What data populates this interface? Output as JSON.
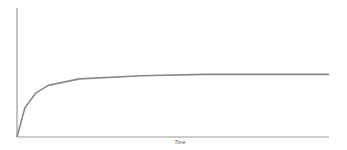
{
  "chart_data": {
    "type": "line",
    "title": "",
    "xlabel": "Time",
    "ylabel": "",
    "grid": false,
    "legend": null,
    "series": [
      {
        "name": "curve",
        "color": "#888888",
        "points": [
          [
            0,
            0
          ],
          [
            0.025,
            0.45
          ],
          [
            0.06,
            0.68
          ],
          [
            0.1,
            0.8
          ],
          [
            0.2,
            0.9
          ],
          [
            0.4,
            0.95
          ],
          [
            0.6,
            0.97
          ],
          [
            0.8,
            0.97
          ],
          [
            1.0,
            0.97
          ]
        ]
      }
    ],
    "xlim": [
      0,
      1
    ],
    "ylim": [
      0,
      2
    ]
  },
  "axes": {
    "x_label": "Time"
  }
}
